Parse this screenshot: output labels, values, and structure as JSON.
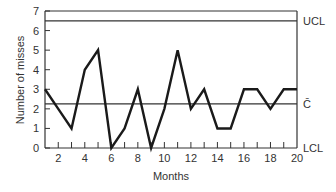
{
  "chart_data": {
    "type": "line",
    "title": "",
    "xlabel": "Months",
    "ylabel": "Number of misses",
    "x": [
      1,
      2,
      3,
      4,
      5,
      6,
      7,
      8,
      9,
      10,
      11,
      12,
      13,
      14,
      15,
      16,
      17,
      18,
      19,
      20
    ],
    "series": [
      {
        "name": "Misses",
        "values": [
          3,
          2,
          1,
          4,
          5,
          0,
          1,
          3,
          0,
          2,
          5,
          2,
          3,
          1,
          1,
          3,
          3,
          2,
          3,
          3
        ]
      }
    ],
    "xlim": [
      1,
      20
    ],
    "ylim": [
      0,
      7
    ],
    "x_ticks": [
      2,
      4,
      6,
      8,
      10,
      12,
      14,
      16,
      18,
      20
    ],
    "y_ticks": [
      0,
      1,
      2,
      3,
      4,
      5,
      6,
      7
    ],
    "grid": false,
    "control_lines": [
      {
        "label": "UCL",
        "value": 6.5
      },
      {
        "label": "C̄",
        "value": 2.25
      },
      {
        "label": "LCL",
        "value": 0
      }
    ]
  },
  "labels": {
    "xlabel": "Months",
    "ylabel": "Number of misses",
    "ucl": "UCL",
    "cbar": "C̄",
    "lcl": "LCL"
  },
  "colors": {
    "line": "#1a1a1a",
    "axis": "#333333",
    "text": "#333333"
  }
}
